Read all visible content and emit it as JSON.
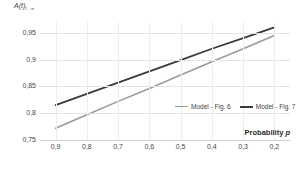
{
  "chart_data": {
    "type": "line",
    "title": "",
    "ylabel": "A(t)",
    "ylabel_sub": "t→∞",
    "xlabel": "Probability",
    "xlabel_italic": "p",
    "x": [
      0.9,
      0.8,
      0.7,
      0.6,
      0.5,
      0.4,
      0.3,
      0.2
    ],
    "xticks": [
      "0,9",
      "0,8",
      "0,7",
      "0,6",
      "0,5",
      "0,4",
      "0,3",
      "0,2"
    ],
    "yticks": [
      "0,95",
      "0,9",
      "0,85",
      "0,8",
      "0,75"
    ],
    "ytick_values": [
      0.95,
      0.9,
      0.85,
      0.8,
      0.75
    ],
    "xlim": [
      0.95,
      0.15
    ],
    "ylim": [
      0.75,
      0.97
    ],
    "grid": true,
    "legend_position": "inside-lower-right",
    "series": [
      {
        "name": "Model - Fig. 6",
        "color": "#9a9a9a",
        "width": 1.6,
        "values": [
          0.772,
          0.797,
          0.822,
          0.846,
          0.871,
          0.896,
          0.92,
          0.945
        ]
      },
      {
        "name": "Model - Fig. 7",
        "color": "#3a3a3a",
        "width": 1.7,
        "values": [
          0.815,
          0.836,
          0.857,
          0.878,
          0.899,
          0.92,
          0.94,
          0.96
        ]
      }
    ]
  },
  "legend": {
    "items": [
      {
        "label": "Model - Fig. 6",
        "color": "#9a9a9a",
        "thickness": "1.4px"
      },
      {
        "label": "Model - Fig. 7",
        "color": "#3a3a3a",
        "thickness": "2px"
      }
    ]
  }
}
